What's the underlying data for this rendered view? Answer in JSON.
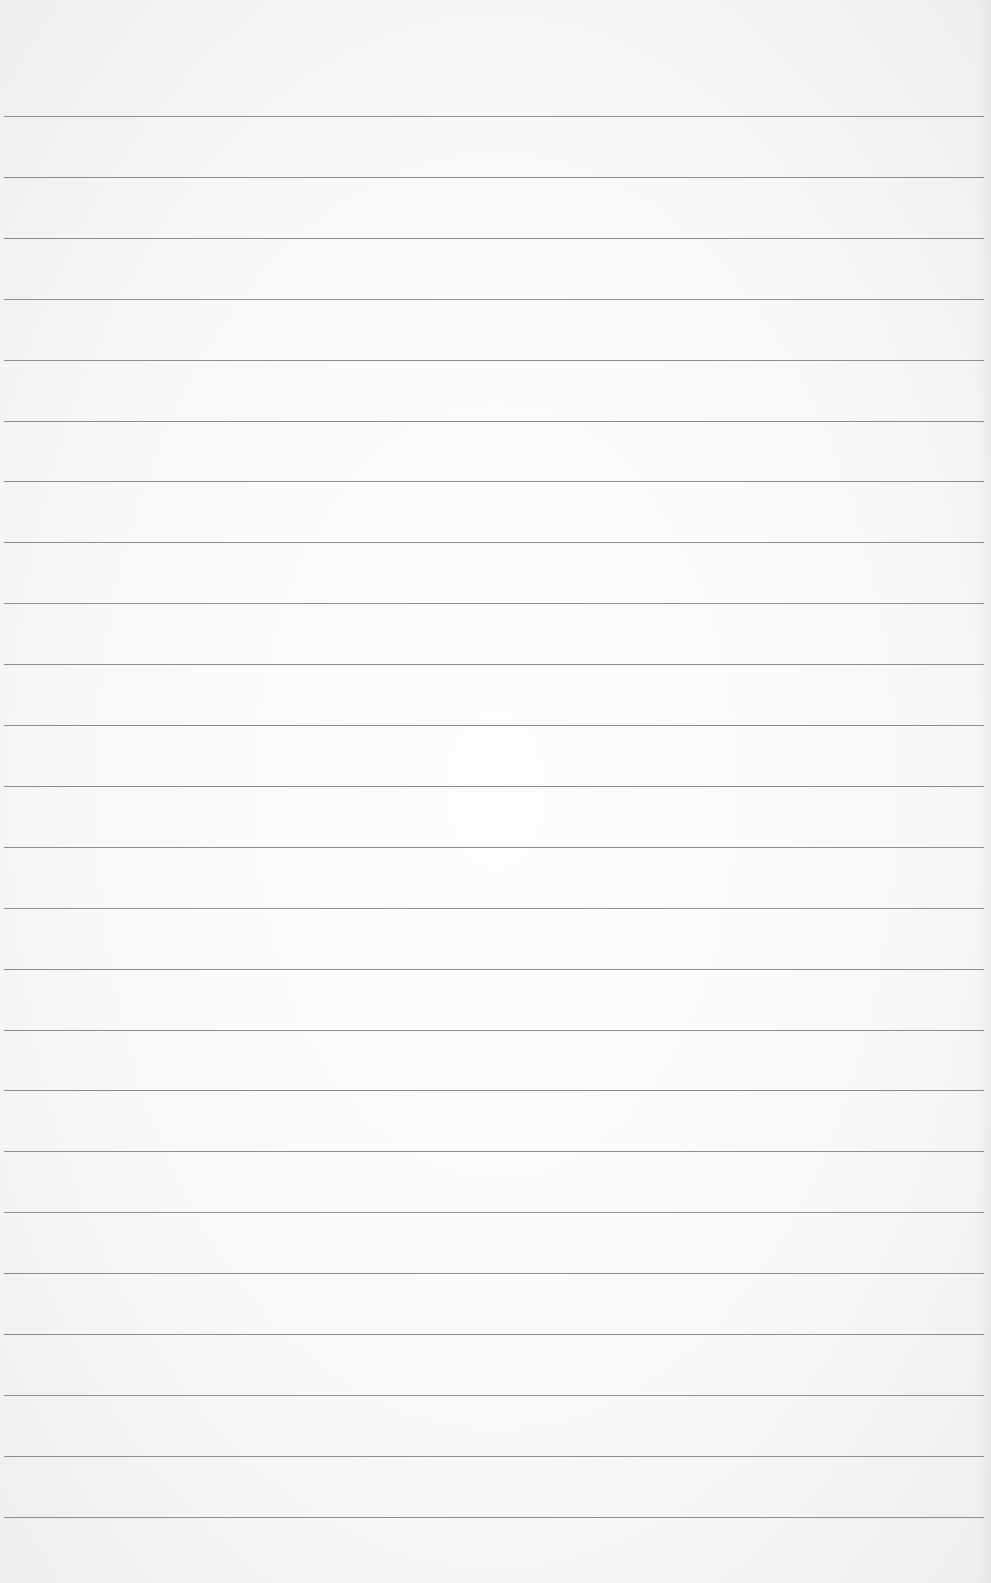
{
  "page": {
    "type": "lined-notebook-paper",
    "background_color": "#f8f8f8",
    "rule_color": "#7d7d7d",
    "rule_count": 24,
    "first_rule_y": 116,
    "rule_spacing": 60.9,
    "rule_left": 4,
    "rule_right": 984,
    "text": ""
  }
}
